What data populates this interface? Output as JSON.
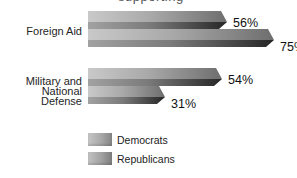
{
  "header": {
    "cropped_text": "supporting"
  },
  "categories": [
    {
      "label": "Foreign Aid"
    },
    {
      "label": "Military and National Defense",
      "line1": "Military and",
      "line2": "National Defense"
    }
  ],
  "chart_data": {
    "type": "bar",
    "orientation": "horizontal",
    "style": "3d-gray-gradient-pointed-bars",
    "categories": [
      "Foreign Aid",
      "Military and National Defense"
    ],
    "series": [
      {
        "name": "Democrats",
        "values": [
          56,
          54
        ]
      },
      {
        "name": "Republicans",
        "values": [
          75,
          31
        ]
      }
    ],
    "bars": [
      {
        "group": "Foreign Aid",
        "party": "Democrats",
        "value": 56,
        "label": "56%"
      },
      {
        "group": "Foreign Aid",
        "party": "Republicans",
        "value": 75,
        "label": "75%"
      },
      {
        "group": "Military and National Defense",
        "party": "Democrats",
        "value": 54,
        "label": "54%"
      },
      {
        "group": "Military and National Defense",
        "party": "Republicans",
        "value": 31,
        "label": "31%"
      }
    ],
    "xlim": [
      0,
      100
    ],
    "grid": false,
    "legend_position": "bottom-left"
  },
  "legend": {
    "items": [
      {
        "label": "Democrats"
      },
      {
        "label": "Republicans"
      }
    ]
  },
  "colors": {
    "background": "#ffffff",
    "bar_top_face_start": "#c9c9c9",
    "bar_top_face_end": "#6e6e6e",
    "bar_front_face_start": "#a2a2a2",
    "bar_front_face_end": "#262626",
    "text": "#1c1c1c"
  }
}
